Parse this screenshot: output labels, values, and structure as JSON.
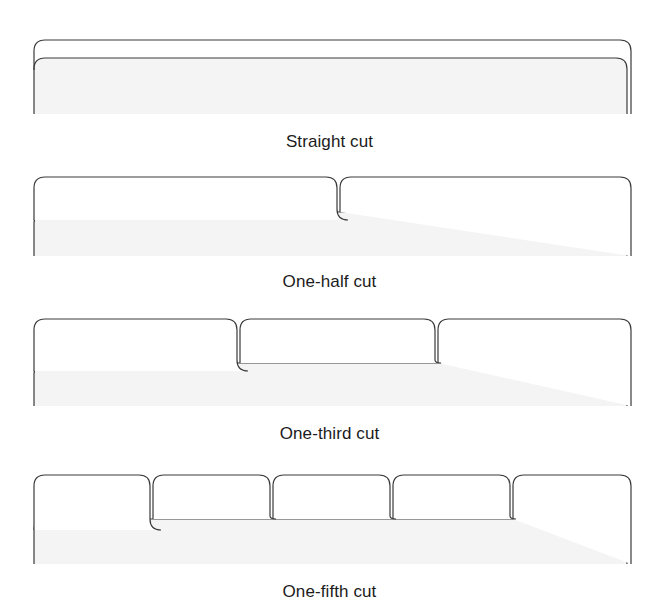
{
  "document": {
    "type": "illustration",
    "subject": "File folder tab cut styles",
    "background_color": "#ffffff",
    "line_color": "#3a3a3a",
    "body_fill_color": "#f4f4f4",
    "tab_fill_color": "#ffffff"
  },
  "figures": [
    {
      "id": "straight-cut",
      "caption": "Straight cut",
      "tab_count": 1,
      "tab_positions_percent": [
        0
      ],
      "tab_width_percent": 100,
      "description": "Single full-width tab spanning the entire folder top"
    },
    {
      "id": "one-half-cut",
      "caption": "One-half cut",
      "tab_count": 2,
      "tab_positions_percent": [
        0,
        50
      ],
      "tab_width_percent": 50,
      "description": "Two tabs each spanning one half of the folder top"
    },
    {
      "id": "one-third-cut",
      "caption": "One-third cut",
      "tab_count": 3,
      "tab_positions_percent": [
        0,
        33.33,
        66.66
      ],
      "tab_width_percent": 33.33,
      "description": "Three tabs each spanning one third of the folder top"
    },
    {
      "id": "one-fifth-cut",
      "caption": "One-fifth cut",
      "tab_count": 5,
      "tab_positions_percent": [
        0,
        20,
        40,
        60,
        80
      ],
      "tab_width_percent": 20,
      "description": "Five tabs each spanning one fifth of the folder top"
    }
  ],
  "geometry": {
    "left_x": 34,
    "right_x": 627,
    "tab_top_y": 10,
    "body_top_y": 28,
    "body_bottom_y": 75,
    "corner_radius": 11
  }
}
